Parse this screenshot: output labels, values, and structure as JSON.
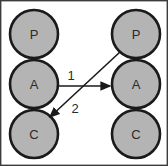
{
  "diagram": {
    "frame": {
      "border_color": "#3c3c3c",
      "background_color": "#ffffff",
      "width": 168,
      "height": 166
    },
    "node_style": {
      "fill_color": "#b4b4b4",
      "stroke_color": "#1a1a1a",
      "radius": 24
    },
    "columns": [
      {
        "name": "left-column",
        "nodes": [
          {
            "id": "left-p",
            "label": "P",
            "cx": 34,
            "cy": 34
          },
          {
            "id": "left-a",
            "label": "A",
            "cx": 34,
            "cy": 84
          },
          {
            "id": "left-c",
            "label": "C",
            "cx": 34,
            "cy": 134
          }
        ]
      },
      {
        "name": "right-column",
        "nodes": [
          {
            "id": "right-p",
            "label": "P",
            "cx": 136,
            "cy": 34
          },
          {
            "id": "right-a",
            "label": "A",
            "cx": 136,
            "cy": 84
          },
          {
            "id": "right-c",
            "label": "C",
            "cx": 136,
            "cy": 134
          }
        ]
      }
    ],
    "edges": [
      {
        "id": "edge-1",
        "label": "1",
        "from": "left-a",
        "to": "right-a",
        "label_x": 71,
        "label_y": 75,
        "x1": 59,
        "y1": 86,
        "x2": 111,
        "y2": 86
      },
      {
        "id": "edge-2",
        "label": "2",
        "from": "right-p",
        "to": "left-c",
        "label_x": 75,
        "label_y": 108,
        "x1": 120,
        "y1": 52,
        "x2": 50,
        "y2": 117
      }
    ]
  }
}
